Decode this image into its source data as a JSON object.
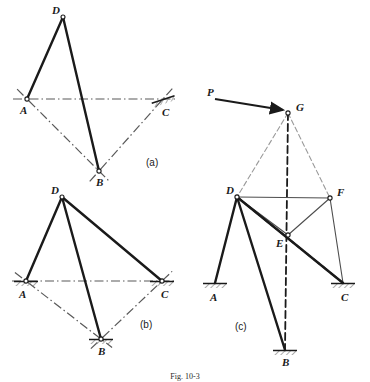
{
  "figure": {
    "caption": "Fig. 10-3",
    "background_color": "#ffffff",
    "ink_color": "#1a1a1a",
    "chain_line_color": "#595959",
    "thin_line_color": "#4d4d4d",
    "hatch_color": "#808080",
    "parts": [
      {
        "key": "a",
        "label": "(a)",
        "label_x": 146,
        "label_y": 166
      },
      {
        "key": "b",
        "label": "(b)",
        "label_x": 140,
        "label_y": 328
      },
      {
        "key": "c",
        "label": "(c)",
        "label_x": 235,
        "label_y": 330
      }
    ],
    "part_a": {
      "points": {
        "A": {
          "x": 27,
          "y": 99,
          "label": "A",
          "label_x": 20,
          "label_y": 114
        },
        "B": {
          "x": 99,
          "y": 171,
          "label": "B",
          "label_x": 96,
          "label_y": 186
        },
        "C": {
          "x": 163,
          "y": 99,
          "label": "C",
          "label_x": 162,
          "label_y": 116
        },
        "D": {
          "x": 63,
          "y": 17,
          "label": "D",
          "label_x": 52,
          "label_y": 14
        }
      },
      "solid_members": [
        {
          "from": "A",
          "to": "D",
          "name": "member-ad"
        },
        {
          "from": "D",
          "to": "B",
          "name": "member-db"
        }
      ],
      "chain_lines": [
        {
          "from": "A",
          "to": "C",
          "name": "axis-ac",
          "extend": 14
        },
        {
          "from": "A",
          "to": "B",
          "name": "axis-ab",
          "extend": 14
        },
        {
          "from": "B",
          "to": "C",
          "name": "axis-bc",
          "extend": 14
        }
      ],
      "supports": [
        {
          "at": "C",
          "type": "hatched-ground",
          "angle": -18,
          "name": "support-c"
        }
      ],
      "pin_markers": [
        {
          "at": "A",
          "name": "pin-a"
        },
        {
          "at": "B",
          "name": "pin-b"
        }
      ]
    },
    "part_b": {
      "points": {
        "A": {
          "x": 26,
          "y": 281,
          "label": "A",
          "label_x": 19,
          "label_y": 298
        },
        "B": {
          "x": 101,
          "y": 339,
          "label": "B",
          "label_x": 98,
          "label_y": 355
        },
        "C": {
          "x": 162,
          "y": 281,
          "label": "C",
          "label_x": 161,
          "label_y": 298
        },
        "D": {
          "x": 62,
          "y": 197,
          "label": "D",
          "label_x": 51,
          "label_y": 194
        }
      },
      "solid_members": [
        {
          "from": "A",
          "to": "D",
          "name": "member-ad"
        },
        {
          "from": "D",
          "to": "B",
          "name": "member-db"
        },
        {
          "from": "D",
          "to": "C",
          "name": "member-dc"
        }
      ],
      "chain_lines": [
        {
          "from": "A",
          "to": "C",
          "name": "axis-ac",
          "extend": 14
        },
        {
          "from": "A",
          "to": "B",
          "name": "axis-ab",
          "extend": 14
        },
        {
          "from": "B",
          "to": "C",
          "name": "axis-bc",
          "extend": 14
        }
      ],
      "supports": [
        {
          "at": "A",
          "type": "hatched-ground",
          "angle": 0,
          "name": "support-a"
        },
        {
          "at": "C",
          "type": "hatched-ground",
          "angle": 0,
          "name": "support-c"
        },
        {
          "at": "B",
          "type": "hatched-ground",
          "angle": 0,
          "name": "support-b"
        }
      ],
      "pin_markers": [
        {
          "at": "A",
          "name": "pin-a"
        },
        {
          "at": "C",
          "name": "pin-c"
        },
        {
          "at": "B",
          "name": "pin-b"
        }
      ]
    },
    "part_c": {
      "points": {
        "A": {
          "x": 215,
          "y": 283,
          "label": "A",
          "label_x": 210,
          "label_y": 301
        },
        "B": {
          "x": 285,
          "y": 350,
          "label": "B",
          "label_x": 282,
          "label_y": 366
        },
        "C": {
          "x": 343,
          "y": 283,
          "label": "C",
          "label_x": 341,
          "label_y": 301
        },
        "D": {
          "x": 237,
          "y": 197,
          "label": "D",
          "label_x": 226,
          "label_y": 194
        },
        "E": {
          "x": 288,
          "y": 235,
          "label": "E",
          "label_x": 276,
          "label_y": 247
        },
        "F": {
          "x": 330,
          "y": 198,
          "label": "F",
          "label_x": 337,
          "label_y": 196
        },
        "G": {
          "x": 288,
          "y": 113,
          "label": "G",
          "label_x": 296,
          "label_y": 111
        }
      },
      "load": {
        "label": "P",
        "label_x": 207,
        "label_y": 96,
        "arrow_from": {
          "x": 215,
          "y": 99
        },
        "arrow_to": {
          "x": 283,
          "y": 110
        },
        "name": "load-arrow-p"
      },
      "thick_members": [
        {
          "from": "D",
          "to": "A",
          "name": "member-da"
        },
        {
          "from": "D",
          "to": "B",
          "name": "member-db"
        },
        {
          "from": "D",
          "to": "C",
          "name": "member-dc"
        }
      ],
      "thin_members": [
        {
          "from": "D",
          "to": "F",
          "name": "member-df"
        },
        {
          "from": "D",
          "to": "E",
          "name": "member-de"
        },
        {
          "from": "E",
          "to": "F",
          "name": "member-ef"
        },
        {
          "from": "F",
          "to": "C",
          "name": "member-fc"
        }
      ],
      "dashed_lines": [
        {
          "from": "G",
          "to": "D",
          "name": "construction-gd",
          "style": "light"
        },
        {
          "from": "G",
          "to": "F",
          "name": "construction-gf",
          "style": "light"
        },
        {
          "from": "G",
          "to": "B",
          "name": "construction-gb",
          "style": "heavy"
        },
        {
          "from": "D",
          "to": "C",
          "name": "construction-dc",
          "style": "heavy"
        }
      ],
      "supports": [
        {
          "at": "A",
          "type": "hatched-ground",
          "angle": 0,
          "name": "support-a"
        },
        {
          "at": "C",
          "type": "hatched-ground",
          "angle": 0,
          "name": "support-c"
        },
        {
          "at": "B",
          "type": "hatched-ground",
          "angle": 0,
          "name": "support-b"
        }
      ],
      "joint_circles": [
        {
          "at": "D",
          "name": "joint-d"
        },
        {
          "at": "F",
          "name": "joint-f"
        },
        {
          "at": "E",
          "name": "joint-e"
        },
        {
          "at": "G",
          "name": "joint-g"
        }
      ]
    }
  }
}
